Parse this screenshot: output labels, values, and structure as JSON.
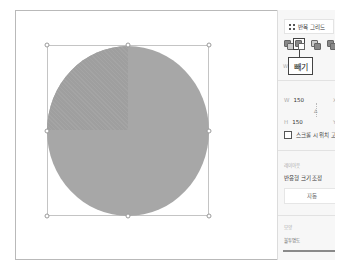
{
  "canvas": {
    "shape": {
      "type": "circle",
      "fill": "#a7a7a7",
      "cut_quadrant_fill": "#9f9f9f"
    },
    "selection_handles": 8
  },
  "panel": {
    "repeat_grid_label": "반복 그리드",
    "boolean_ops": [
      {
        "name": "union",
        "selected": false
      },
      {
        "name": "subtract",
        "selected": true
      },
      {
        "name": "intersect",
        "selected": false
      },
      {
        "name": "exclude",
        "selected": false
      }
    ],
    "tooltip": "빼기",
    "rotation_label": "W",
    "width_label": "W",
    "width_value": "150",
    "height_label": "H",
    "height_value": "150",
    "x_label": "X",
    "y_label": "Y",
    "lock_glyph": "∆",
    "fix_position_label": "스크롤 시 위치 고",
    "layout_section": "레이아웃",
    "responsive_resize_label": "반응형 크기 조정",
    "auto_button": "자동",
    "appearance_section": "모양",
    "opacity_label": "불투명도"
  }
}
